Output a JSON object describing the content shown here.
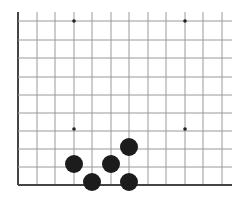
{
  "board": {
    "description": "Partial Go board (lower-left corner region) with black stones",
    "colors": {
      "background": "#ffffff",
      "line": "#9a9a9a",
      "edge": "#444444",
      "stone": "#1c1c1c",
      "star": "#222222"
    },
    "grid": {
      "x_lines": [
        18,
        37,
        55,
        74,
        92,
        111,
        129,
        148,
        166,
        185,
        203,
        222
      ],
      "y_lines": [
        21,
        40,
        58,
        77,
        95,
        113,
        131,
        149,
        167,
        185
      ],
      "x_extent": [
        18,
        232
      ],
      "y_extent": [
        12,
        185
      ],
      "left_edge": true,
      "bottom_edge": true
    },
    "star_points": [
      {
        "x": 74,
        "y": 21
      },
      {
        "x": 185,
        "y": 21
      },
      {
        "x": 74,
        "y": 129
      },
      {
        "x": 185,
        "y": 129
      }
    ],
    "stones": [
      {
        "color": "black",
        "x": 74,
        "y": 164
      },
      {
        "color": "black",
        "x": 92,
        "y": 182
      },
      {
        "color": "black",
        "x": 111,
        "y": 164
      },
      {
        "color": "black",
        "x": 129,
        "y": 147
      },
      {
        "color": "black",
        "x": 129,
        "y": 182
      }
    ]
  }
}
